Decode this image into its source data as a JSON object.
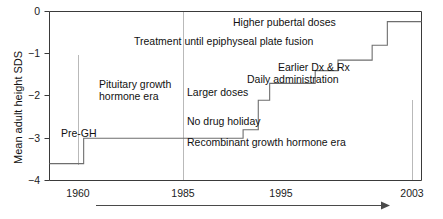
{
  "chart_data": {
    "type": "line",
    "subtype": "step",
    "title": "",
    "xlabel": "",
    "ylabel": "Mean adult height SDS",
    "xlim": [
      1956,
      2005
    ],
    "ylim": [
      -4,
      0
    ],
    "x_ticks": [
      1960,
      1985,
      1995,
      2003
    ],
    "x_tick_labels": [
      "1960",
      "1985",
      "1995",
      "2003"
    ],
    "y_ticks": [
      0,
      -1,
      -2,
      -3,
      -4
    ],
    "y_tick_labels": [
      "0",
      "−1",
      "−2",
      "−3",
      "−4"
    ],
    "grid": false,
    "legend": null,
    "series": [
      {
        "name": "Mean adult height SDS",
        "step": "post",
        "points": [
          {
            "x": 1956.0,
            "y": -3.6
          },
          {
            "x": 1960.5,
            "y": -3.6
          },
          {
            "x": 1960.5,
            "y": -3.0
          },
          {
            "x": 1981.5,
            "y": -3.0
          },
          {
            "x": 1981.5,
            "y": -2.8
          },
          {
            "x": 1983.5,
            "y": -2.8
          },
          {
            "x": 1983.5,
            "y": -2.1
          },
          {
            "x": 1985.0,
            "y": -2.1
          },
          {
            "x": 1985.0,
            "y": -1.7
          },
          {
            "x": 1991.0,
            "y": -1.7
          },
          {
            "x": 1991.0,
            "y": -1.4
          },
          {
            "x": 1994.0,
            "y": -1.4
          },
          {
            "x": 1994.0,
            "y": -1.15
          },
          {
            "x": 1998.5,
            "y": -1.15
          },
          {
            "x": 1998.5,
            "y": -0.8
          },
          {
            "x": 2000.5,
            "y": -0.8
          },
          {
            "x": 2000.5,
            "y": -0.24
          },
          {
            "x": 2005.0,
            "y": -0.24
          }
        ]
      }
    ],
    "vertical_markers": [
      {
        "x": 1960,
        "y_top": -1.0,
        "y_bottom": -3.6,
        "color": "#b9b9b9"
      },
      {
        "x": 1985,
        "y_top": 0.0,
        "y_bottom": -4.0,
        "color": "#b9b9b9"
      },
      {
        "x": 2003,
        "y_top": -2.1,
        "y_bottom": -4.0,
        "color": "#b9b9b9"
      }
    ],
    "annotations": [
      {
        "text": "Pre-GH",
        "x": 1961.5,
        "y": -2.72
      },
      {
        "text": "Pituitary growth",
        "x": 1968.0,
        "y": -1.72
      },
      {
        "text": "hormone era",
        "x": 1968.0,
        "y": -2.0
      },
      {
        "text": "Larger doses",
        "x": 1985.8,
        "y": -1.88
      },
      {
        "text": "No drug holiday",
        "x": 1985.8,
        "y": -2.43
      },
      {
        "text": "Recombinant growth hormone era",
        "x": 1985.8,
        "y": -2.92
      },
      {
        "text": "Daily administration",
        "x": 1991.8,
        "y": -1.55
      },
      {
        "text": "Earlier Dx & Rx",
        "x": 1994.8,
        "y": -1.28
      },
      {
        "text": "Treatment until epiphyseal plate fusion",
        "x": 1977.2,
        "y": -0.93
      },
      {
        "text": "Higher pubertal doses",
        "x": 1993.8,
        "y": -0.42
      }
    ],
    "timeline_arrow": {
      "label": "",
      "direction": "right",
      "x_start": 1960.0,
      "x_end": 2000.0
    }
  }
}
